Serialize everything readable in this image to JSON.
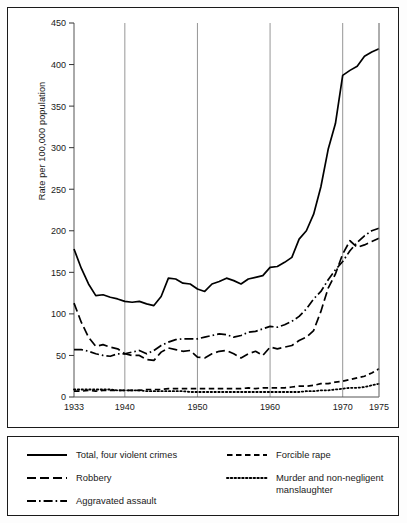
{
  "figure": {
    "background_color": "#fdfdfd",
    "frame_color": "#1a1a1a",
    "plot_background": "#ffffff"
  },
  "axis": {
    "ylabel": "Rate per 100,000 population",
    "yticks": [
      0,
      50,
      100,
      150,
      200,
      250,
      300,
      350,
      400,
      450
    ],
    "ytick_labels": [
      "0",
      "50",
      "100",
      "150",
      "200",
      "250",
      "300",
      "350",
      "400",
      "450"
    ],
    "xticks": [
      1933,
      1940,
      1950,
      1960,
      1970,
      1975
    ],
    "xtick_labels": [
      "1933",
      "1940",
      "1950",
      "1960",
      "1970",
      "1975"
    ],
    "gridline_years": [
      1940,
      1950,
      1960,
      1970,
      1975
    ]
  },
  "legend": {
    "position": "below-plot",
    "entries": [
      {
        "label": "Total, four violent crimes",
        "style": "solid",
        "column": "left"
      },
      {
        "label": "Robbery",
        "style": "long-dash",
        "column": "left"
      },
      {
        "label": "Aggravated assault",
        "style": "dash-dot",
        "column": "left"
      },
      {
        "label": "Forcible rape",
        "style": "dash",
        "column": "right"
      },
      {
        "label": "Murder and non-negligent",
        "label_line2": "manslaughter",
        "style": "dotted",
        "column": "right"
      }
    ]
  },
  "chart_data": {
    "type": "line",
    "title": "",
    "subtitle": "",
    "xlabel": "",
    "ylabel": "Rate per 100,000 population",
    "xlim": [
      1933,
      1975
    ],
    "ylim": [
      0,
      450
    ],
    "grid": "vertical-only",
    "legend_position": "below",
    "x": [
      1933,
      1934,
      1935,
      1936,
      1937,
      1938,
      1939,
      1940,
      1941,
      1942,
      1943,
      1944,
      1945,
      1946,
      1947,
      1948,
      1949,
      1950,
      1951,
      1952,
      1953,
      1954,
      1955,
      1956,
      1957,
      1958,
      1959,
      1960,
      1961,
      1962,
      1963,
      1964,
      1965,
      1966,
      1967,
      1968,
      1969,
      1970,
      1971,
      1972,
      1973,
      1974,
      1975
    ],
    "series": [
      {
        "name": "Total, four violent crimes",
        "style": "solid",
        "values": [
          178,
          155,
          136,
          122,
          123,
          120,
          118,
          115,
          114,
          115,
          112,
          110,
          121,
          143,
          142,
          137,
          136,
          130,
          127,
          136,
          139,
          143,
          140,
          136,
          142,
          144,
          146,
          156,
          157,
          162,
          168,
          190,
          200,
          220,
          253,
          298,
          329,
          387,
          393,
          398,
          410,
          415,
          419
        ]
      },
      {
        "name": "Robbery",
        "style": "long-dash",
        "values": [
          113,
          90,
          72,
          61,
          63,
          60,
          58,
          52,
          50,
          50,
          45,
          44,
          54,
          59,
          57,
          55,
          56,
          48,
          47,
          52,
          55,
          56,
          52,
          47,
          52,
          55,
          50,
          60,
          58,
          60,
          62,
          68,
          72,
          80,
          103,
          131,
          148,
          172,
          188,
          180,
          183,
          187,
          191
        ]
      },
      {
        "name": "Aggravated assault",
        "style": "dash-dot",
        "values": [
          57,
          57,
          55,
          52,
          50,
          49,
          52,
          52,
          54,
          56,
          52,
          56,
          62,
          66,
          69,
          70,
          70,
          70,
          72,
          74,
          76,
          75,
          72,
          74,
          78,
          79,
          82,
          85,
          84,
          87,
          91,
          97,
          106,
          118,
          127,
          141,
          153,
          163,
          176,
          186,
          194,
          200,
          203
        ]
      },
      {
        "name": "Forcible rape",
        "style": "dash",
        "values": [
          7,
          7,
          8,
          7,
          8,
          8,
          8,
          8,
          8,
          8,
          9,
          9,
          9,
          10,
          10,
          10,
          10,
          10,
          10,
          10,
          10,
          10,
          10,
          10,
          11,
          10,
          11,
          11,
          11,
          11,
          12,
          13,
          13,
          14,
          16,
          16,
          18,
          19,
          21,
          23,
          25,
          29,
          34
        ]
      },
      {
        "name": "Murder and non-negligent manslaughter",
        "style": "dotted",
        "values": [
          9,
          9,
          9,
          9,
          9,
          9,
          8,
          8,
          8,
          8,
          7,
          7,
          7,
          7,
          7,
          7,
          6,
          6,
          6,
          6,
          6,
          6,
          6,
          6,
          6,
          6,
          6,
          6,
          6,
          6,
          6,
          6,
          7,
          7,
          8,
          8,
          9,
          10,
          11,
          11,
          12,
          14,
          16
        ]
      }
    ]
  }
}
